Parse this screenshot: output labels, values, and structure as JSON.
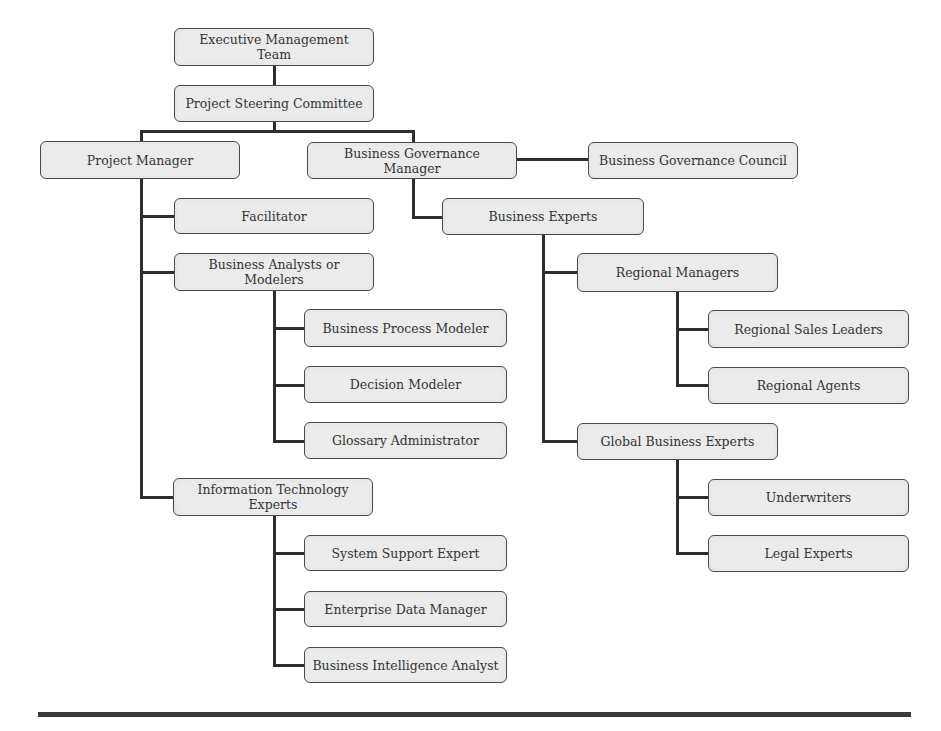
{
  "diagram": {
    "type": "organization-chart",
    "colors": {
      "node_fill": "#ebebeb",
      "node_border": "#4a4a4a",
      "connector": "#2e2e2e",
      "text": "#333333",
      "rule": "#3a3a3a"
    },
    "nodes": {
      "executive_management_team": "Executive Management Team",
      "project_steering_committee": "Project Steering Committee",
      "project_manager": "Project Manager",
      "business_governance_manager": "Business Governance Manager",
      "business_governance_council": "Business Governance Council",
      "facilitator": "Facilitator",
      "business_analysts_or_modelers": "Business Analysts or\nModelers",
      "business_process_modeler": "Business Process Modeler",
      "decision_modeler": "Decision Modeler",
      "glossary_administrator": "Glossary Administrator",
      "information_technology_experts": "Information Technology\nExperts",
      "system_support_expert": "System Support Expert",
      "enterprise_data_manager": "Enterprise Data Manager",
      "business_intelligence_analyst": "Business Intelligence Analyst",
      "business_experts": "Business Experts",
      "regional_managers": "Regional Managers",
      "regional_sales_leaders": "Regional Sales Leaders",
      "regional_agents": "Regional Agents",
      "global_business_experts": "Global Business Experts",
      "underwriters": "Underwriters",
      "legal_experts": "Legal Experts"
    },
    "edges": [
      [
        "executive_management_team",
        "project_steering_committee"
      ],
      [
        "project_steering_committee",
        "project_manager"
      ],
      [
        "project_steering_committee",
        "business_governance_manager"
      ],
      [
        "business_governance_manager",
        "business_governance_council"
      ],
      [
        "project_manager",
        "facilitator"
      ],
      [
        "project_manager",
        "business_analysts_or_modelers"
      ],
      [
        "project_manager",
        "information_technology_experts"
      ],
      [
        "business_analysts_or_modelers",
        "business_process_modeler"
      ],
      [
        "business_analysts_or_modelers",
        "decision_modeler"
      ],
      [
        "business_analysts_or_modelers",
        "glossary_administrator"
      ],
      [
        "information_technology_experts",
        "system_support_expert"
      ],
      [
        "information_technology_experts",
        "enterprise_data_manager"
      ],
      [
        "information_technology_experts",
        "business_intelligence_analyst"
      ],
      [
        "business_governance_manager",
        "business_experts"
      ],
      [
        "business_experts",
        "regional_managers"
      ],
      [
        "business_experts",
        "global_business_experts"
      ],
      [
        "regional_managers",
        "regional_sales_leaders"
      ],
      [
        "regional_managers",
        "regional_agents"
      ],
      [
        "global_business_experts",
        "underwriters"
      ],
      [
        "global_business_experts",
        "legal_experts"
      ]
    ]
  }
}
